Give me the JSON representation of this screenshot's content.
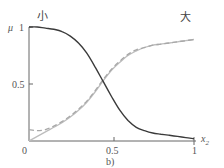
{
  "chart_data": {
    "type": "line",
    "title": "",
    "subtitle": "b)",
    "xlabel": "x2",
    "ylabel": "μ",
    "xlim": [
      0,
      1
    ],
    "ylim": [
      0,
      1
    ],
    "x_ticks": [
      "0",
      "0.5",
      "1"
    ],
    "y_ticks": [
      "0.5",
      "1"
    ],
    "grid": false,
    "annotations": [
      {
        "text": "小",
        "x": 0.08,
        "y": 1.05,
        "series": "small"
      },
      {
        "text": "大",
        "x": 0.95,
        "y": 1.05,
        "series": "large"
      }
    ],
    "series": [
      {
        "name": "小 (small)",
        "style": "solid-dark",
        "color": "#3a3a3a",
        "x": [
          0,
          0.05,
          0.1,
          0.15,
          0.2,
          0.25,
          0.3,
          0.35,
          0.4,
          0.45,
          0.5,
          0.55,
          0.6,
          0.65,
          0.7,
          0.75,
          0.8,
          0.85,
          0.9,
          0.95,
          1.0
        ],
        "values": [
          1.0,
          1.0,
          0.99,
          0.98,
          0.96,
          0.92,
          0.86,
          0.77,
          0.65,
          0.52,
          0.39,
          0.27,
          0.18,
          0.12,
          0.09,
          0.07,
          0.06,
          0.05,
          0.04,
          0.03,
          0.02
        ]
      },
      {
        "name": "大 (large) fit",
        "style": "solid-light",
        "color": "#bdbdbd",
        "x": [
          0,
          0.05,
          0.1,
          0.15,
          0.2,
          0.25,
          0.3,
          0.35,
          0.4,
          0.45,
          0.5,
          0.55,
          0.6,
          0.65,
          0.7,
          0.75,
          0.8,
          0.85,
          0.9,
          0.95,
          1.0
        ],
        "values": [
          0.0,
          0.04,
          0.08,
          0.12,
          0.16,
          0.21,
          0.27,
          0.34,
          0.43,
          0.53,
          0.62,
          0.69,
          0.75,
          0.79,
          0.82,
          0.84,
          0.85,
          0.86,
          0.87,
          0.88,
          0.89
        ]
      },
      {
        "name": "大 (large) reference",
        "style": "dashed-light",
        "color": "#a8a8a8",
        "x": [
          0,
          0.05,
          0.1,
          0.15,
          0.2,
          0.25,
          0.3,
          0.35,
          0.4,
          0.45,
          0.5,
          0.55,
          0.6,
          0.65,
          0.7,
          0.75,
          0.8,
          0.85,
          0.9,
          0.95,
          1.0
        ],
        "values": [
          0.1,
          0.09,
          0.1,
          0.13,
          0.17,
          0.22,
          0.28,
          0.35,
          0.44,
          0.54,
          0.63,
          0.7,
          0.76,
          0.8,
          0.82,
          0.84,
          0.85,
          0.86,
          0.87,
          0.88,
          0.89
        ]
      }
    ]
  },
  "labels": {
    "y_axis": "μ",
    "x_axis_main": "x",
    "x_axis_sub": "2",
    "tick_x0": "0",
    "tick_x05": "0.5",
    "tick_x1": "1",
    "tick_y05": "0.5",
    "tick_y1": "1",
    "caption": "b)",
    "small": "小",
    "large": "大"
  }
}
